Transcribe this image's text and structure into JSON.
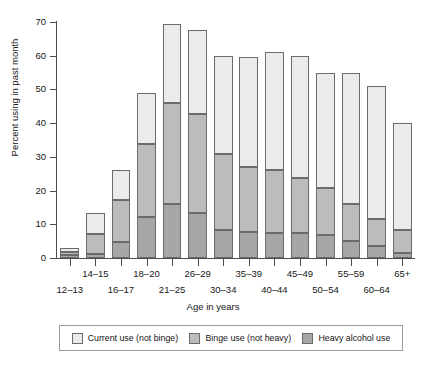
{
  "chart_data": {
    "type": "bar",
    "subtype": "stacked-vertical",
    "title": "",
    "xlabel": "Age in years",
    "ylabel": "Percent using in past month",
    "ylim": [
      0,
      70
    ],
    "yticks": [
      0,
      10,
      20,
      30,
      40,
      50,
      60,
      70
    ],
    "grid": false,
    "legend_position": "bottom",
    "categories": [
      "12–13",
      "14–15",
      "16–17",
      "18–20",
      "21–25",
      "26–29",
      "30–34",
      "35–39",
      "40–44",
      "45–49",
      "50–54",
      "55–59",
      "60–64",
      "65+"
    ],
    "series": [
      {
        "name": "Heavy alcohol use",
        "color": "#a6a6a6",
        "values": [
          0.8,
          1.3,
          4.7,
          12.3,
          16.1,
          13.4,
          8.2,
          7.6,
          7.3,
          7.4,
          6.8,
          5.0,
          3.5,
          1.6
        ]
      },
      {
        "name": "Binge use (not heavy)",
        "color": "#bcbcbc",
        "values": [
          0.9,
          5.7,
          12.5,
          21.4,
          30.0,
          29.3,
          22.8,
          19.5,
          18.8,
          16.4,
          13.9,
          10.9,
          8.2,
          6.7
        ]
      },
      {
        "name": "Current use (not binge)",
        "color": "#ebebeb",
        "values": [
          1.3,
          6.5,
          8.8,
          15.3,
          23.4,
          24.8,
          29.0,
          32.4,
          34.9,
          36.2,
          34.3,
          39.1,
          39.3,
          31.7
        ]
      }
    ],
    "totals": [
      3.0,
      13.5,
      26.0,
      49.0,
      69.5,
      67.5,
      60.0,
      59.5,
      61.0,
      60.0,
      55.0,
      55.0,
      51.0,
      40.0
    ]
  },
  "legend": {
    "items": [
      {
        "label": "Current use (not binge)",
        "color": "#ebebeb"
      },
      {
        "label": "Binge use (not heavy)",
        "color": "#bcbcbc"
      },
      {
        "label": "Heavy alcohol use",
        "color": "#a6a6a6"
      }
    ]
  }
}
